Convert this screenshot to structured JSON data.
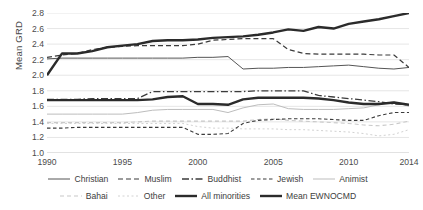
{
  "chart_data": {
    "type": "line",
    "title": "",
    "xlabel": "",
    "ylabel": "Mean GRD",
    "xlim": [
      1990,
      2014
    ],
    "ylim": [
      1.0,
      2.8
    ],
    "ytick_step": 0.2,
    "grid": true,
    "legend_position": "bottom",
    "x": [
      1990,
      1991,
      1992,
      1993,
      1994,
      1995,
      1996,
      1997,
      1998,
      1999,
      2000,
      2001,
      2002,
      2003,
      2004,
      2005,
      2006,
      2007,
      2008,
      2009,
      2010,
      2011,
      2012,
      2013,
      2014
    ],
    "xticks": [
      "1990",
      "1995",
      "2000",
      "2005",
      "2010",
      "2014"
    ],
    "yticks": [
      "1.0",
      "1.2",
      "1.4",
      "1.6",
      "1.8",
      "2.0",
      "2.2",
      "2.4",
      "2.6",
      "2.8"
    ],
    "series": [
      {
        "name": "Christian",
        "style": "solid-thin",
        "color": "#555555",
        "values": [
          2.21,
          2.22,
          2.22,
          2.22,
          2.22,
          2.22,
          2.22,
          2.22,
          2.22,
          2.22,
          2.23,
          2.23,
          2.24,
          2.08,
          2.09,
          2.09,
          2.1,
          2.1,
          2.11,
          2.12,
          2.13,
          2.11,
          2.09,
          2.08,
          2.1
        ]
      },
      {
        "name": "Muslim",
        "style": "dashed",
        "color": "#3b3b3b",
        "values": [
          2.23,
          2.26,
          2.28,
          2.33,
          2.36,
          2.37,
          2.38,
          2.38,
          2.38,
          2.38,
          2.4,
          2.45,
          2.46,
          2.47,
          2.47,
          2.47,
          2.33,
          2.28,
          2.27,
          2.27,
          2.27,
          2.27,
          2.26,
          2.26,
          2.1
        ]
      },
      {
        "name": "Buddhist",
        "style": "dash-dot",
        "color": "#3b3b3b",
        "values": [
          1.69,
          1.69,
          1.69,
          1.7,
          1.7,
          1.7,
          1.7,
          1.79,
          1.79,
          1.79,
          1.79,
          1.79,
          1.79,
          1.79,
          1.8,
          1.8,
          1.8,
          1.8,
          1.74,
          1.72,
          1.7,
          1.68,
          1.66,
          1.63,
          1.62
        ]
      },
      {
        "name": "Jewish",
        "style": "dashed-fine",
        "color": "#3b3b3b",
        "values": [
          1.32,
          1.32,
          1.33,
          1.33,
          1.33,
          1.33,
          1.33,
          1.33,
          1.33,
          1.33,
          1.24,
          1.24,
          1.25,
          1.38,
          1.42,
          1.43,
          1.44,
          1.44,
          1.44,
          1.43,
          1.42,
          1.42,
          1.48,
          1.52,
          1.52
        ]
      },
      {
        "name": "Animist",
        "style": "solid-light",
        "color": "#bdbdbd",
        "values": [
          1.5,
          1.5,
          1.5,
          1.5,
          1.5,
          1.5,
          1.52,
          1.55,
          1.56,
          1.56,
          1.56,
          1.56,
          1.52,
          1.58,
          1.62,
          1.63,
          1.57,
          1.56,
          1.56,
          1.56,
          1.57,
          1.58,
          1.62,
          1.66,
          1.6
        ]
      },
      {
        "name": "Bahai",
        "style": "dashed-light",
        "color": "#c8c8c8",
        "values": [
          1.39,
          1.39,
          1.39,
          1.39,
          1.39,
          1.39,
          1.4,
          1.41,
          1.41,
          1.41,
          1.41,
          1.41,
          1.41,
          1.41,
          1.43,
          1.44,
          1.42,
          1.41,
          1.4,
          1.39,
          1.38,
          1.36,
          1.35,
          1.37,
          1.41
        ]
      },
      {
        "name": "Other",
        "style": "dotted-light",
        "color": "#d2d2d2",
        "values": [
          1.38,
          1.38,
          1.38,
          1.38,
          1.38,
          1.38,
          1.38,
          1.38,
          1.38,
          1.38,
          1.34,
          1.32,
          1.32,
          1.31,
          1.31,
          1.31,
          1.3,
          1.3,
          1.29,
          1.28,
          1.27,
          1.25,
          1.22,
          1.24,
          1.3
        ]
      },
      {
        "name": "All minorities",
        "style": "solid-bold",
        "color": "#2b2b2b",
        "values": [
          1.68,
          1.68,
          1.68,
          1.68,
          1.68,
          1.68,
          1.68,
          1.69,
          1.72,
          1.73,
          1.63,
          1.63,
          1.62,
          1.69,
          1.71,
          1.71,
          1.71,
          1.71,
          1.7,
          1.68,
          1.65,
          1.63,
          1.63,
          1.65,
          1.62
        ]
      },
      {
        "name": "Mean EWNOCMD",
        "style": "solid-bold",
        "color": "#2b2b2b",
        "values": [
          2.0,
          2.28,
          2.28,
          2.31,
          2.36,
          2.38,
          2.4,
          2.44,
          2.45,
          2.45,
          2.46,
          2.48,
          2.49,
          2.5,
          2.52,
          2.55,
          2.59,
          2.57,
          2.62,
          2.6,
          2.66,
          2.69,
          2.72,
          2.76,
          2.8
        ]
      }
    ]
  },
  "legend": {
    "rows": [
      [
        {
          "label": "Christian",
          "style": "solid-thin"
        },
        {
          "label": "Muslim",
          "style": "dashed"
        },
        {
          "label": "Buddhist",
          "style": "dash-dot"
        },
        {
          "label": "Jewish",
          "style": "dashed-fine"
        },
        {
          "label": "Animist",
          "style": "solid-light"
        }
      ],
      [
        {
          "label": "Bahai",
          "style": "dashed-light"
        },
        {
          "label": "Other",
          "style": "dotted-light"
        },
        {
          "label": "All minorities",
          "style": "solid-bold"
        },
        {
          "label": "Mean EWNOCMD",
          "style": "solid-bold"
        }
      ]
    ]
  },
  "colors": {
    "grid": "#e6e6e6",
    "axis_text": "#4b4b4b",
    "dark": "#2b2b2b",
    "light": "#c8c8c8"
  }
}
